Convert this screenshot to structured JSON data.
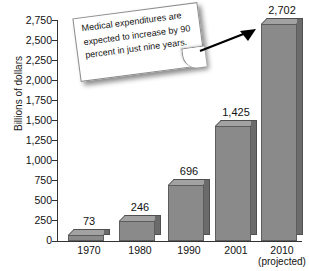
{
  "chart_data": {
    "type": "bar",
    "title": "",
    "xlabel": "",
    "ylabel": "Billions of dollars",
    "categories": [
      "1970",
      "1980",
      "1990",
      "2001",
      "2010"
    ],
    "category_sublabels": [
      "",
      "",
      "",
      "",
      "(projected)"
    ],
    "values": [
      73,
      246,
      696,
      1425,
      2702
    ],
    "value_labels": [
      "73",
      "246",
      "696",
      "1,425",
      "2,702"
    ],
    "ylim": [
      0,
      2750
    ],
    "ytick_step": 250,
    "ytick_labels": [
      "2,750",
      "2,500",
      "2,250",
      "2,000",
      "1,750",
      "1,500",
      "1,250",
      "1,000",
      "750",
      "500",
      "250",
      "0"
    ],
    "ytick_values": [
      2750,
      2500,
      2250,
      2000,
      1750,
      1500,
      1250,
      1000,
      750,
      500,
      250,
      0
    ],
    "grid": false,
    "legend": false,
    "bar_color": "#8a8a8a",
    "bar_side_color": "#6b6b6b",
    "bar_top_color": "#a2a2a2",
    "axis_color": "#333333",
    "annotations": [
      {
        "name": "callout-note",
        "text": "Medical expenditures are expected to increase by 90 percent in just nine years.",
        "points_to": "2010"
      }
    ]
  }
}
